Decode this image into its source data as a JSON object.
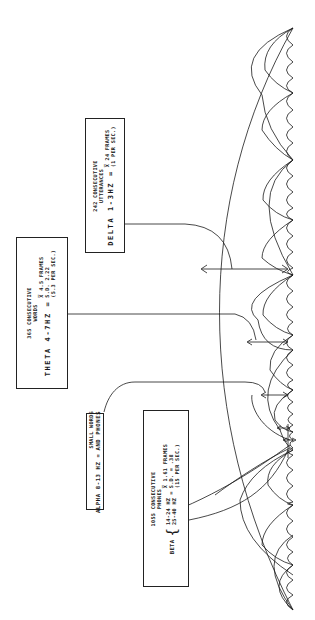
{
  "diagram": {
    "orientation": "rotated 90 degrees counterclockwise",
    "colors": {
      "ink": "#1a1a1a",
      "background": "#ffffff"
    },
    "baseline": {
      "description": "scalloped baseline of smallest (beta) cycles"
    },
    "boxes": {
      "delta": {
        "header": [
          "242 CONSECUTIVE",
          "UTTERANCES"
        ],
        "band": "DELTA 1-3HZ =",
        "stats": [
          "X̅ 24 FRAMES",
          "(1 PER SEC.)"
        ]
      },
      "theta": {
        "header": [
          "365 CONSECUTIVE",
          "WORDS"
        ],
        "band": "THETA 4-7HZ =",
        "stats": [
          "X̅ 4.5 FRAMES",
          "S.D. 2.22",
          "(5.3 PER SEC.)"
        ]
      },
      "alpha": {
        "header": [
          "SMALL WORDS"
        ],
        "band": "ALPHA 8-13 HZ =",
        "stats": [
          "AND PHONES"
        ]
      },
      "beta": {
        "header": [
          "1055 CONSECUTIVE",
          "PHONES"
        ],
        "band_label": "BETA",
        "band_ranges": [
          "14-24 HZ",
          "25-40 HZ"
        ],
        "equals": "=",
        "stats": [
          "X̅ 1.61 FRAMES",
          "S.D. = .38",
          "(15 PER SEC.)"
        ]
      }
    }
  }
}
